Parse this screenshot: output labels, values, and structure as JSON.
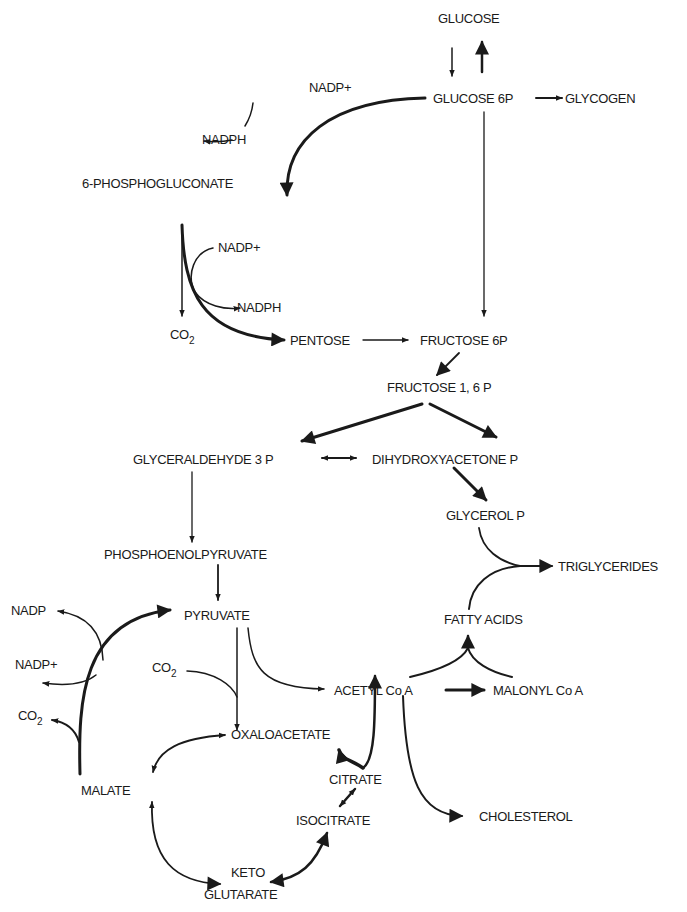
{
  "diagram": {
    "type": "metabolic-pathway",
    "nodes": {
      "glucose": "GLUCOSE",
      "glucose_6p": "GLUCOSE 6P",
      "glycogen": "GLYCOGEN",
      "nadp_plus_1": "NADP+",
      "nadph_1": "NADPH",
      "phosphogluconate": "6-PHOSPHOGLUCONATE",
      "nadp_plus_2": "NADP+",
      "nadph_2": "NADPH",
      "co2_1": "CO",
      "co2_1_sub": "2",
      "pentose": "PENTOSE",
      "fructose_6p": "FRUCTOSE 6P",
      "fructose_16p": "FRUCTOSE 1, 6 P",
      "glyceraldehyde_3p": "GLYCERALDEHYDE 3 P",
      "dihydroxyacetone_p": "DIHYDROXYACETONE  P",
      "glycerol_p": "GLYCEROL P",
      "triglycerides": "TRIGLYCERIDES",
      "phosphoenolpyruvate": "PHOSPHOENOLPYRUVATE",
      "pyruvate": "PYRUVATE",
      "fatty_acids": "FATTY ACIDS",
      "nadp": "NADP",
      "nadp_plus_3": "NADP+",
      "co2_2": "CO",
      "co2_2_sub": "2",
      "co2_3": "CO",
      "co2_3_sub": "2",
      "acetyl_coa": "ACETYL Co A",
      "malonyl_coa": "MALONYL Co A",
      "oxaloacetate": "OXALOACETATE",
      "malate": "MALATE",
      "citrate": "CITRATE",
      "isocitrate": "ISOCITRATE",
      "cholesterol": "CHOLESTEROL",
      "keto": "KETO",
      "glutarate": "GLUTARATE"
    },
    "edges": [
      {
        "from": "GLUCOSE",
        "to": "GLUCOSE 6P"
      },
      {
        "from": "GLUCOSE 6P",
        "to": "GLUCOSE"
      },
      {
        "from": "GLUCOSE 6P",
        "to": "GLYCOGEN"
      },
      {
        "from": "GLUCOSE 6P",
        "to": "6-PHOSPHOGLUCONATE",
        "cofactor_in": "NADP+",
        "cofactor_out": "NADPH"
      },
      {
        "from": "GLUCOSE 6P",
        "to": "FRUCTOSE 6P"
      },
      {
        "from": "6-PHOSPHOGLUCONATE",
        "to": "PENTOSE",
        "cofactor_in": "NADP+",
        "cofactor_out": "NADPH",
        "byproduct": "CO2"
      },
      {
        "from": "PENTOSE",
        "to": "FRUCTOSE 6P"
      },
      {
        "from": "FRUCTOSE 6P",
        "to": "FRUCTOSE 1, 6 P"
      },
      {
        "from": "FRUCTOSE 1, 6 P",
        "to": "GLYCERALDEHYDE 3 P"
      },
      {
        "from": "FRUCTOSE 1, 6 P",
        "to": "DIHYDROXYACETONE P"
      },
      {
        "from": "GLYCERALDEHYDE 3 P",
        "to": "DIHYDROXYACETONE P",
        "bidirectional": true
      },
      {
        "from": "DIHYDROXYACETONE P",
        "to": "GLYCEROL P"
      },
      {
        "from": "GLYCEROL P",
        "to": "TRIGLYCERIDES"
      },
      {
        "from": "FATTY ACIDS",
        "to": "TRIGLYCERIDES"
      },
      {
        "from": "GLYCERALDEHYDE 3 P",
        "to": "PHOSPHOENOLPYRUVATE"
      },
      {
        "from": "PHOSPHOENOLPYRUVATE",
        "to": "PYRUVATE"
      },
      {
        "from": "MALATE",
        "to": "PYRUVATE",
        "cofactor_in": "NADP+",
        "cofactor_out": "NADP",
        "byproduct": "CO2"
      },
      {
        "from": "PYRUVATE",
        "to": "OXALOACETATE",
        "cofactor_in": "CO2"
      },
      {
        "from": "PYRUVATE",
        "to": "ACETYL Co A"
      },
      {
        "from": "ACETYL Co A",
        "to": "MALONYL Co A"
      },
      {
        "from": "ACETYL Co A",
        "to": "FATTY ACIDS",
        "with": "MALONYL Co A"
      },
      {
        "from": "ACETYL Co A",
        "to": "CHOLESTEROL"
      },
      {
        "from": "CITRATE",
        "to": "ACETYL Co A"
      },
      {
        "from": "CITRATE",
        "to": "OXALOACETATE"
      },
      {
        "from": "OXALOACETATE",
        "to": "MALATE",
        "bidirectional": true
      },
      {
        "from": "CITRATE",
        "to": "ISOCITRATE",
        "bidirectional": true
      },
      {
        "from": "ISOCITRATE",
        "to": "KETO GLUTARATE",
        "bidirectional": true
      },
      {
        "from": "MALATE",
        "to": "KETO GLUTARATE",
        "bidirectional": true
      }
    ]
  }
}
